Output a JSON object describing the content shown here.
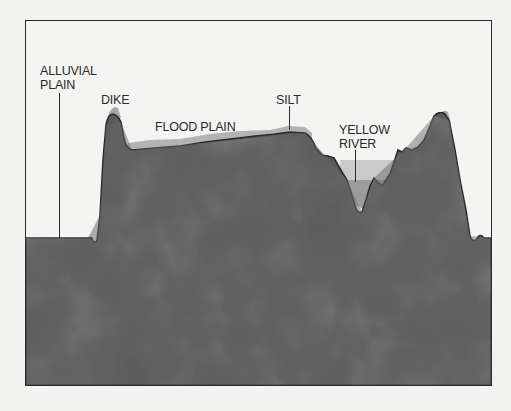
{
  "diagram": {
    "type": "cross-section",
    "labels": {
      "alluvial_plain_line1": "ALLUVIAL",
      "alluvial_plain_line2": "PLAIN",
      "dike": "DIKE",
      "flood_plain": "FLOOD PLAIN",
      "silt": "SILT",
      "yellow_river_line1": "YELLOW",
      "yellow_river_line2": "RIVER"
    },
    "colors": {
      "background": "#f4f4f2",
      "ground": "#5e5e5e",
      "ground_dark": "#4a4a4a",
      "silt": "#a8a8a8",
      "flood_water": "#c9c9c9",
      "river_water": "#9a9a9a",
      "outline": "#2a2a2a"
    }
  }
}
